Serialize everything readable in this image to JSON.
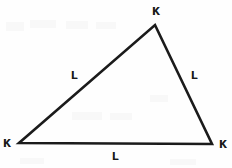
{
  "figure": {
    "type": "geometry-diagram",
    "shape": "triangle",
    "background_color": "#fefefe",
    "stroke_color": "#1b1b1b",
    "text_color": "#1b1b1b",
    "stroke_width": 2.6,
    "width": 232,
    "height": 168
  },
  "vertices": [
    {
      "id": "apex",
      "label": "K",
      "x": 155,
      "y": 25,
      "label_x": 152,
      "label_y": 6
    },
    {
      "id": "bottom-left",
      "label": "K",
      "x": 19,
      "y": 143,
      "label_x": 3,
      "label_y": 138
    },
    {
      "id": "bottom-right",
      "label": "K",
      "x": 212,
      "y": 144,
      "label_x": 219,
      "label_y": 139
    }
  ],
  "sides": [
    {
      "id": "left-side",
      "label": "L",
      "from": "bottom-left",
      "to": "apex",
      "label_x": 71,
      "label_y": 70
    },
    {
      "id": "right-side",
      "label": "L",
      "from": "apex",
      "to": "bottom-right",
      "label_x": 191,
      "label_y": 70
    },
    {
      "id": "bottom-side",
      "label": "L",
      "from": "bottom-left",
      "to": "bottom-right",
      "label_x": 112,
      "label_y": 151
    }
  ],
  "artifacts": [
    {
      "x": 6,
      "y": 22,
      "w": 18,
      "h": 9
    },
    {
      "x": 30,
      "y": 20,
      "w": 26,
      "h": 8
    },
    {
      "x": 66,
      "y": 21,
      "w": 22,
      "h": 8
    },
    {
      "x": 96,
      "y": 22,
      "w": 20,
      "h": 7
    },
    {
      "x": 150,
      "y": 95,
      "w": 18,
      "h": 7
    },
    {
      "x": 72,
      "y": 112,
      "w": 30,
      "h": 8
    },
    {
      "x": 110,
      "y": 113,
      "w": 22,
      "h": 7
    },
    {
      "x": 20,
      "y": 158,
      "w": 24,
      "h": 6
    },
    {
      "x": 170,
      "y": 159,
      "w": 26,
      "h": 6
    }
  ]
}
